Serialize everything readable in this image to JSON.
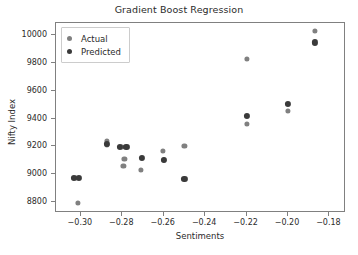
{
  "chart_data": {
    "type": "scatter",
    "title": "Gradient Boost Regression",
    "xlabel": "Sentiments",
    "ylabel": "Nifty Index",
    "xlim": [
      -0.312,
      -0.172
    ],
    "ylim": [
      8720,
      10090
    ],
    "xticks": [
      -0.3,
      -0.28,
      -0.26,
      -0.24,
      -0.22,
      -0.2,
      -0.18
    ],
    "xtick_labels": [
      "−0.30",
      "−0.28",
      "−0.26",
      "−0.24",
      "−0.22",
      "−0.20",
      "−0.18"
    ],
    "yticks": [
      8800,
      9000,
      9200,
      9400,
      9600,
      9800,
      10000
    ],
    "ytick_labels": [
      "8800",
      "9000",
      "9200",
      "9400",
      "9600",
      "9800",
      "10000"
    ],
    "grid": false,
    "legend_position": "upper left",
    "series": [
      {
        "name": "Actual",
        "color": "#808080",
        "marker": "circle",
        "points": [
          {
            "x": -0.3015,
            "y": 8790
          },
          {
            "x": -0.3025,
            "y": 8975
          },
          {
            "x": -0.2875,
            "y": 9240
          },
          {
            "x": -0.2875,
            "y": 9215
          },
          {
            "x": -0.28,
            "y": 9195
          },
          {
            "x": -0.279,
            "y": 9110
          },
          {
            "x": -0.2795,
            "y": 9060
          },
          {
            "x": -0.271,
            "y": 9030
          },
          {
            "x": -0.2605,
            "y": 9170
          },
          {
            "x": -0.26,
            "y": 9100
          },
          {
            "x": -0.25,
            "y": 9205
          },
          {
            "x": -0.22,
            "y": 9830
          },
          {
            "x": -0.22,
            "y": 9360
          },
          {
            "x": -0.2,
            "y": 9455
          },
          {
            "x": -0.187,
            "y": 10035
          }
        ]
      },
      {
        "name": "Predicted",
        "color": "#3a3a3a",
        "marker": "circle",
        "points": [
          {
            "x": -0.3035,
            "y": 8975
          },
          {
            "x": -0.301,
            "y": 8975
          },
          {
            "x": -0.2875,
            "y": 9220
          },
          {
            "x": -0.281,
            "y": 9195
          },
          {
            "x": -0.278,
            "y": 9195
          },
          {
            "x": -0.2705,
            "y": 9120
          },
          {
            "x": -0.26,
            "y": 9105
          },
          {
            "x": -0.25,
            "y": 8965
          },
          {
            "x": -0.22,
            "y": 9420
          },
          {
            "x": -0.2,
            "y": 9505
          },
          {
            "x": -0.187,
            "y": 9950
          }
        ]
      }
    ]
  }
}
